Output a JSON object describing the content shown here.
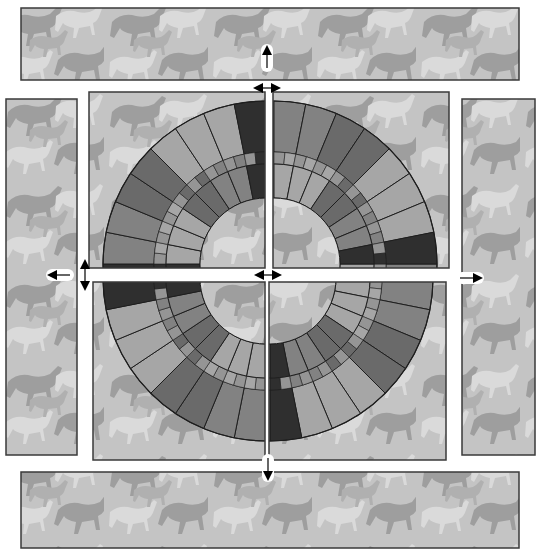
{
  "diagram": {
    "colors": {
      "background": "#ffffff",
      "pattern_base": "#c4c4c4",
      "horse_dark": "#9c9c9c",
      "horse_light": "#dcdcdc",
      "panel_border": "#3a3a3a",
      "tile_dark": "#2f2f2f",
      "tile_mid_dark": "#6a6a6a",
      "tile_mid": "#828282",
      "tile_light": "#a6a6a6",
      "tile_band": "#959595",
      "arrow": "#000000",
      "arrow_halo": "#ffffff"
    },
    "strips": [
      {
        "id": "top",
        "x": 21,
        "y": 8,
        "w": 498,
        "h": 72
      },
      {
        "id": "left",
        "x": 6,
        "y": 99,
        "w": 71,
        "h": 356
      },
      {
        "id": "right",
        "x": 462,
        "y": 99,
        "w": 73,
        "h": 356
      },
      {
        "id": "bottom",
        "x": 21,
        "y": 472,
        "w": 498,
        "h": 76
      }
    ],
    "quadrants": [
      {
        "id": "top-left",
        "x": 89,
        "y": 92,
        "w": 176,
        "h": 176,
        "dx": -4,
        "dy": -6
      },
      {
        "id": "top-right",
        "x": 273,
        "y": 92,
        "w": 176,
        "h": 176,
        "dx": 4,
        "dy": -6
      },
      {
        "id": "bottom-left",
        "x": 93,
        "y": 282,
        "w": 172,
        "h": 178,
        "dx": -4,
        "dy": 8
      },
      {
        "id": "bottom-right",
        "x": 269,
        "y": 282,
        "w": 177,
        "h": 178,
        "dx": 0,
        "dy": 8
      }
    ],
    "ring": {
      "cx": 270,
      "cy": 270,
      "outer_r": 163,
      "band_outer_r": 112,
      "band_inner_r": 100,
      "inner_r": 66,
      "segments": 32
    },
    "arrows": [
      {
        "id": "up",
        "direction": "up",
        "x": 267,
        "y": 58
      },
      {
        "id": "horizontal-top",
        "direction": "left-right",
        "x": 267,
        "y": 88
      },
      {
        "id": "left",
        "direction": "left",
        "x": 60,
        "y": 275
      },
      {
        "id": "vertical-left",
        "direction": "up-down",
        "x": 85,
        "y": 275
      },
      {
        "id": "center",
        "direction": "left-right",
        "x": 268,
        "y": 275
      },
      {
        "id": "right",
        "direction": "right",
        "x": 470,
        "y": 278
      },
      {
        "id": "down",
        "direction": "down",
        "x": 268,
        "y": 468
      }
    ]
  }
}
